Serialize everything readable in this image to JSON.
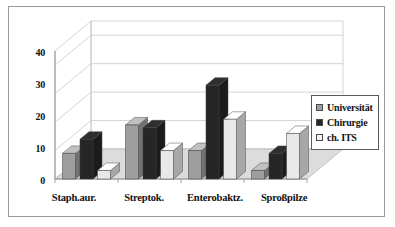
{
  "chart_data": {
    "type": "bar",
    "title": "",
    "subtitle": "",
    "xlabel": "",
    "ylabel": "",
    "categories": [
      "Staph.aur.",
      "Streptok.",
      "Enterobaktz.",
      "Sproßpilze"
    ],
    "series": [
      {
        "name": "Universität",
        "color": "#9e9e9e",
        "values": [
          9,
          19,
          10,
          3
        ]
      },
      {
        "name": "Chirurgie",
        "color": "#262626",
        "values": [
          14,
          18,
          33,
          9
        ]
      },
      {
        "name": "ch. ITS",
        "color": "#e8e8e8",
        "values": [
          3,
          10,
          21,
          16
        ]
      }
    ],
    "ylim": [
      0,
      45
    ],
    "yticks": [
      0,
      10,
      20,
      30,
      40
    ],
    "ytick_labels": [
      "0",
      "10",
      "20",
      "30",
      "40"
    ],
    "grid": true,
    "grid_axis": "y",
    "legend_position": "right",
    "three_d": true,
    "annotations": []
  },
  "axis": {
    "y_labels": [
      "40",
      "30",
      "20",
      "10",
      "0"
    ]
  },
  "legend": {
    "items": [
      {
        "label": "Universität"
      },
      {
        "label": "Chirurgie"
      },
      {
        "label": "ch. ITS"
      }
    ]
  },
  "colors": {
    "series_universitaet": "#9e9e9e",
    "series_chirurgie": "#262626",
    "series_ch_its": "#e8e8e8",
    "frame_border": "#9a9a9a",
    "grid": "#c9c9c9",
    "floor": "#dcdcdc",
    "background": "#ffffff"
  }
}
